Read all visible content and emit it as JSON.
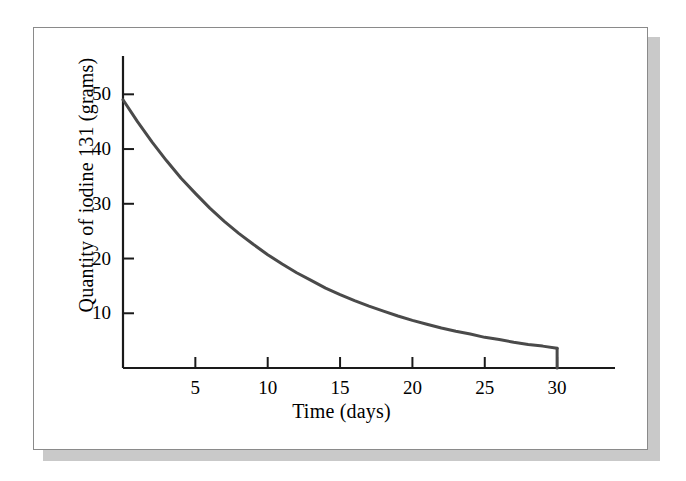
{
  "figure": {
    "background_color": "#ffffff",
    "frame_border_color": "#8a8a8a",
    "shadow_color": "#c9c9c9",
    "curve_color": "#4a4a4a",
    "axis_color": "#1a1a1a"
  },
  "chart_data": {
    "type": "line",
    "title": "",
    "subtitle": "",
    "xlabel": "Time (days)",
    "ylabel": "Quantity of iodine 131 (grams)",
    "xlim": [
      0,
      34
    ],
    "ylim": [
      0,
      57
    ],
    "xticks": [
      5,
      10,
      15,
      20,
      25,
      30
    ],
    "xtick_labels": [
      "5",
      "10",
      "15",
      "20",
      "25",
      "30"
    ],
    "yticks": [
      10,
      20,
      30,
      40,
      50
    ],
    "ytick_labels": [
      "10",
      "20",
      "30",
      "40",
      "50"
    ],
    "grid": false,
    "legend": false,
    "legend_position": "none",
    "annotations": [],
    "series": [
      {
        "name": "Quantity of iodine 131",
        "color": "#4a4a4a",
        "line_width": 3,
        "x": [
          0,
          1,
          2,
          3,
          4,
          5,
          6,
          7,
          8,
          9,
          10,
          11,
          12,
          13,
          14,
          15,
          16,
          17,
          18,
          19,
          20,
          21,
          22,
          23,
          24,
          25,
          26,
          27,
          28,
          29,
          30
        ],
        "values": [
          49,
          45,
          41.3,
          37.9,
          34.7,
          31.9,
          29.2,
          26.8,
          24.6,
          22.6,
          20.7,
          19,
          17.4,
          16,
          14.6,
          13.4,
          12.3,
          11.3,
          10.4,
          9.5,
          8.7,
          8,
          7.3,
          6.7,
          6.2,
          5.6,
          5.2,
          4.7,
          4.3,
          4,
          3.6
        ]
      }
    ],
    "notes": {
      "start_value": 49,
      "end_value": 3.6,
      "half_life_days": 8
    }
  }
}
